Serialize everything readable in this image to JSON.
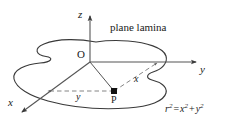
{
  "figure": {
    "type": "math-diagram",
    "background_color": "#ffffff",
    "stroke_color": "#3a3a3a",
    "text_color": "#1a1a1a"
  },
  "caption": {
    "text": "plane lamina"
  },
  "axes": [
    {
      "name": "z-axis",
      "label": "z",
      "direction": "up"
    },
    {
      "name": "y-axis",
      "label": "y",
      "direction": "right"
    },
    {
      "name": "x-axis",
      "label": "x",
      "direction": "down-left"
    }
  ],
  "points": [
    {
      "name": "origin",
      "label": "O"
    },
    {
      "name": "point-p",
      "label": "P"
    }
  ],
  "dimensions": [
    {
      "name": "x-distance",
      "label": "x"
    },
    {
      "name": "y-distance",
      "label": "y"
    }
  ],
  "equation": {
    "lhs_base": "r",
    "lhs_exp": "2",
    "equals": "=",
    "term1_base": "x",
    "term1_exp": "2",
    "plus": "+",
    "term2_base": "y",
    "term2_exp": "2",
    "full_text": "r² = x² + y²"
  }
}
